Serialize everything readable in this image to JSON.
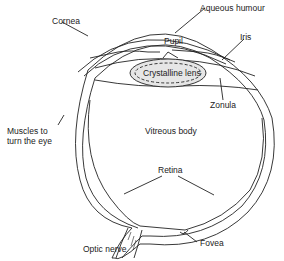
{
  "diagram": {
    "labels": {
      "cornea": "Cornea",
      "aqueous_humour": "Aqueous humour",
      "pupil": "Pupil",
      "iris": "Iris",
      "crystalline_lens": "Crystalline lens",
      "zonula": "Zonula",
      "muscles_line1": "Muscles to",
      "muscles_line2": "turn the eye",
      "vitreous_body": "Vitreous body",
      "retina": "Retina",
      "optic_nerve": "Optic nerve",
      "fovea": "Fovea"
    },
    "colors": {
      "line": "#222222",
      "lens_fill": "#e6e6e6",
      "background": "#ffffff"
    }
  }
}
